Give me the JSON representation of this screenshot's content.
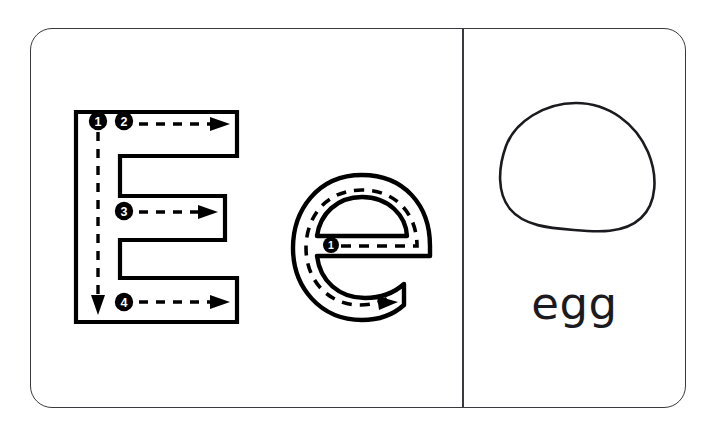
{
  "card": {
    "type": "alphabet-tracing-flashcard",
    "letter_uppercase": "E",
    "letter_lowercase": "e",
    "word": "egg",
    "picture": "egg-oval-outline",
    "background_color": "#ffffff",
    "border_color": "#3a3a3e",
    "ink_color": "#000000"
  },
  "uppercase": {
    "glyph": "E",
    "stroke_count": 4,
    "strokes": [
      {
        "number": "1",
        "badge": "❶",
        "direction": "down",
        "label": "vertical-stem"
      },
      {
        "number": "2",
        "badge": "❷",
        "direction": "right",
        "label": "top-arm"
      },
      {
        "number": "3",
        "badge": "❸",
        "direction": "right",
        "label": "middle-arm"
      },
      {
        "number": "4",
        "badge": "❹",
        "direction": "right",
        "label": "bottom-arm"
      }
    ]
  },
  "lowercase": {
    "glyph": "e",
    "stroke_count": 1,
    "strokes": [
      {
        "number": "1",
        "badge": "❶",
        "direction": "right-then-counterclockwise",
        "label": "crossbar-and-bowl"
      }
    ]
  },
  "picture_panel": {
    "word_label": "egg",
    "illustration_name": "egg"
  }
}
